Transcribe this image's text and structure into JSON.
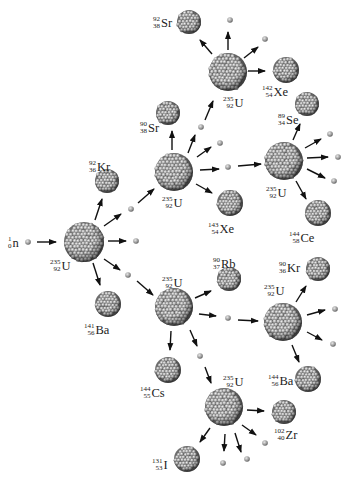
{
  "colors": {
    "nucleus_dark": "#3a3a3a",
    "nucleus_mid": "#8a8a8a",
    "nucleus_light": "#d6d6d6",
    "arrow": "#111111",
    "text": "#222222"
  },
  "neutron_label": {
    "mass": "1",
    "atomic": "0",
    "symbol": "n"
  },
  "nuclei": [
    {
      "id": "u1",
      "kind": "U-235",
      "x": 84,
      "y": 242,
      "r": 20,
      "label": {
        "mass": "235",
        "atomic": "92",
        "symbol": "U",
        "x": 50,
        "y": 259
      }
    },
    {
      "id": "kr92",
      "kind": "product",
      "x": 107,
      "y": 181,
      "r": 12,
      "label": {
        "mass": "92",
        "atomic": "36",
        "symbol": "Kr",
        "x": 89,
        "y": 160
      }
    },
    {
      "id": "ba141",
      "kind": "product",
      "x": 108,
      "y": 304,
      "r": 13,
      "label": {
        "mass": "141",
        "atomic": "56",
        "symbol": "Ba",
        "x": 84,
        "y": 323
      }
    },
    {
      "id": "u2",
      "kind": "U-235",
      "x": 174,
      "y": 172,
      "r": 19,
      "label": {
        "mass": "235",
        "atomic": "92",
        "symbol": "U",
        "x": 162,
        "y": 196
      }
    },
    {
      "id": "sr90",
      "kind": "product",
      "x": 168,
      "y": 113,
      "r": 12,
      "label": {
        "mass": "90",
        "atomic": "38",
        "symbol": "Sr",
        "x": 140,
        "y": 121
      }
    },
    {
      "id": "xe143",
      "kind": "product",
      "x": 230,
      "y": 203,
      "r": 13,
      "label": {
        "mass": "143",
        "atomic": "54",
        "symbol": "Xe",
        "x": 208,
        "y": 222
      }
    },
    {
      "id": "u3",
      "kind": "U-235",
      "x": 228,
      "y": 72,
      "r": 19,
      "label": {
        "mass": "235",
        "atomic": "92",
        "symbol": "U",
        "x": 223,
        "y": 96
      }
    },
    {
      "id": "sr92",
      "kind": "product",
      "x": 189,
      "y": 22,
      "r": 12,
      "label": {
        "mass": "92",
        "atomic": "38",
        "symbol": "Sr",
        "x": 153,
        "y": 16
      }
    },
    {
      "id": "xe142",
      "kind": "product",
      "x": 286,
      "y": 70,
      "r": 13,
      "label": {
        "mass": "142",
        "atomic": "54",
        "symbol": "Xe",
        "x": 262,
        "y": 85
      }
    },
    {
      "id": "u4",
      "kind": "U-235",
      "x": 284,
      "y": 161,
      "r": 19,
      "label": {
        "mass": "235",
        "atomic": "92",
        "symbol": "U",
        "x": 266,
        "y": 186
      }
    },
    {
      "id": "se89",
      "kind": "product",
      "x": 307,
      "y": 104,
      "r": 12,
      "label": {
        "mass": "89",
        "atomic": "34",
        "symbol": "Se",
        "x": 278,
        "y": 113
      }
    },
    {
      "id": "ce144",
      "kind": "product",
      "x": 318,
      "y": 213,
      "r": 13,
      "label": {
        "mass": "144",
        "atomic": "58",
        "symbol": "Ce",
        "x": 289,
        "y": 231
      }
    },
    {
      "id": "u5",
      "kind": "U-235",
      "x": 174,
      "y": 307,
      "r": 19,
      "label": {
        "mass": "235",
        "atomic": "92",
        "symbol": "U",
        "x": 162,
        "y": 276
      }
    },
    {
      "id": "rb90",
      "kind": "product",
      "x": 229,
      "y": 279,
      "r": 12,
      "label": {
        "mass": "90",
        "atomic": "37",
        "symbol": "Rb",
        "x": 213,
        "y": 257
      }
    },
    {
      "id": "cs144",
      "kind": "product",
      "x": 168,
      "y": 370,
      "r": 13,
      "label": {
        "mass": "144",
        "atomic": "55",
        "symbol": "Cs",
        "x": 140,
        "y": 386
      }
    },
    {
      "id": "u6",
      "kind": "U-235",
      "x": 283,
      "y": 322,
      "r": 19,
      "label": {
        "mass": "235",
        "atomic": "92",
        "symbol": "U",
        "x": 264,
        "y": 284
      }
    },
    {
      "id": "kr90",
      "kind": "product",
      "x": 318,
      "y": 269,
      "r": 12,
      "label": {
        "mass": "90",
        "atomic": "36",
        "symbol": "Kr",
        "x": 279,
        "y": 261
      }
    },
    {
      "id": "ba144",
      "kind": "product",
      "x": 308,
      "y": 379,
      "r": 13,
      "label": {
        "mass": "144",
        "atomic": "56",
        "symbol": "Ba",
        "x": 268,
        "y": 374
      }
    },
    {
      "id": "u7",
      "kind": "U-235",
      "x": 224,
      "y": 407,
      "r": 19,
      "label": {
        "mass": "235",
        "atomic": "92",
        "symbol": "U",
        "x": 223,
        "y": 375
      }
    },
    {
      "id": "zr102",
      "kind": "product",
      "x": 284,
      "y": 412,
      "r": 12,
      "label": {
        "mass": "102",
        "atomic": "40",
        "symbol": "Zr",
        "x": 274,
        "y": 428
      }
    },
    {
      "id": "i131",
      "kind": "product",
      "x": 187,
      "y": 459,
      "r": 13,
      "label": {
        "mass": "131",
        "atomic": "53",
        "symbol": "I",
        "x": 152,
        "y": 458
      }
    }
  ],
  "neutrons": [
    {
      "x": 28,
      "y": 242
    },
    {
      "x": 136,
      "y": 241
    },
    {
      "x": 131,
      "y": 209
    },
    {
      "x": 128,
      "y": 275
    },
    {
      "x": 201,
      "y": 127
    },
    {
      "x": 220,
      "y": 143
    },
    {
      "x": 228,
      "y": 167
    },
    {
      "x": 230,
      "y": 20
    },
    {
      "x": 265,
      "y": 39
    },
    {
      "x": 330,
      "y": 134
    },
    {
      "x": 338,
      "y": 157
    },
    {
      "x": 334,
      "y": 181
    },
    {
      "x": 228,
      "y": 318
    },
    {
      "x": 200,
      "y": 356
    },
    {
      "x": 335,
      "y": 309
    },
    {
      "x": 333,
      "y": 344
    },
    {
      "x": 265,
      "y": 443
    },
    {
      "x": 223,
      "y": 463
    },
    {
      "x": 247,
      "y": 459
    }
  ],
  "arrows": [
    {
      "x1": 37,
      "y1": 242,
      "x2": 56,
      "y2": 242
    },
    {
      "x1": 95,
      "y1": 220,
      "x2": 102,
      "y2": 199
    },
    {
      "x1": 104,
      "y1": 226,
      "x2": 121,
      "y2": 214
    },
    {
      "x1": 108,
      "y1": 241,
      "x2": 126,
      "y2": 241
    },
    {
      "x1": 104,
      "y1": 259,
      "x2": 120,
      "y2": 270
    },
    {
      "x1": 93,
      "y1": 263,
      "x2": 100,
      "y2": 285
    },
    {
      "x1": 138,
      "y1": 203,
      "x2": 154,
      "y2": 189
    },
    {
      "x1": 137,
      "y1": 281,
      "x2": 153,
      "y2": 295
    },
    {
      "x1": 172,
      "y1": 150,
      "x2": 172,
      "y2": 131
    },
    {
      "x1": 188,
      "y1": 153,
      "x2": 195,
      "y2": 135
    },
    {
      "x1": 197,
      "y1": 157,
      "x2": 211,
      "y2": 147
    },
    {
      "x1": 200,
      "y1": 170,
      "x2": 219,
      "y2": 169
    },
    {
      "x1": 238,
      "y1": 166,
      "x2": 261,
      "y2": 164
    },
    {
      "x1": 196,
      "y1": 184,
      "x2": 212,
      "y2": 193
    },
    {
      "x1": 205,
      "y1": 120,
      "x2": 213,
      "y2": 101
    },
    {
      "x1": 212,
      "y1": 54,
      "x2": 200,
      "y2": 40
    },
    {
      "x1": 228,
      "y1": 50,
      "x2": 228,
      "y2": 32
    },
    {
      "x1": 244,
      "y1": 58,
      "x2": 258,
      "y2": 47
    },
    {
      "x1": 248,
      "y1": 71,
      "x2": 265,
      "y2": 71
    },
    {
      "x1": 293,
      "y1": 140,
      "x2": 300,
      "y2": 124
    },
    {
      "x1": 305,
      "y1": 148,
      "x2": 321,
      "y2": 139
    },
    {
      "x1": 307,
      "y1": 158,
      "x2": 328,
      "y2": 157
    },
    {
      "x1": 307,
      "y1": 169,
      "x2": 325,
      "y2": 178
    },
    {
      "x1": 296,
      "y1": 181,
      "x2": 306,
      "y2": 199
    },
    {
      "x1": 195,
      "y1": 298,
      "x2": 211,
      "y2": 291
    },
    {
      "x1": 199,
      "y1": 314,
      "x2": 216,
      "y2": 316
    },
    {
      "x1": 238,
      "y1": 320,
      "x2": 258,
      "y2": 321
    },
    {
      "x1": 171,
      "y1": 331,
      "x2": 170,
      "y2": 350
    },
    {
      "x1": 190,
      "y1": 330,
      "x2": 197,
      "y2": 346
    },
    {
      "x1": 205,
      "y1": 367,
      "x2": 211,
      "y2": 383
    },
    {
      "x1": 296,
      "y1": 302,
      "x2": 306,
      "y2": 286
    },
    {
      "x1": 307,
      "y1": 315,
      "x2": 325,
      "y2": 310
    },
    {
      "x1": 307,
      "y1": 332,
      "x2": 322,
      "y2": 340
    },
    {
      "x1": 292,
      "y1": 345,
      "x2": 299,
      "y2": 362
    },
    {
      "x1": 247,
      "y1": 410,
      "x2": 264,
      "y2": 411
    },
    {
      "x1": 242,
      "y1": 425,
      "x2": 256,
      "y2": 435
    },
    {
      "x1": 235,
      "y1": 433,
      "x2": 241,
      "y2": 452
    },
    {
      "x1": 225,
      "y1": 434,
      "x2": 224,
      "y2": 451
    },
    {
      "x1": 210,
      "y1": 428,
      "x2": 200,
      "y2": 442
    }
  ]
}
